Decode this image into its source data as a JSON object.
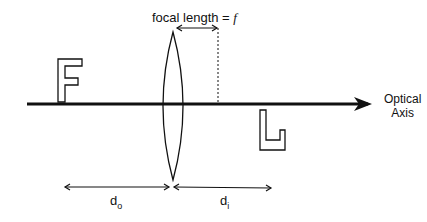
{
  "diagram": {
    "focal_label": {
      "text": "focal length = ",
      "symbol": "f"
    },
    "axis_label": {
      "line1": "Optical",
      "line2": "Axis"
    },
    "object_distance": {
      "base": "d",
      "sub": "o"
    },
    "image_distance": {
      "base": "d",
      "sub": "i"
    },
    "object_letter": "F",
    "image_letter": "F (inverted)",
    "colors": {
      "stroke": "#111111",
      "background": "#ffffff"
    }
  }
}
